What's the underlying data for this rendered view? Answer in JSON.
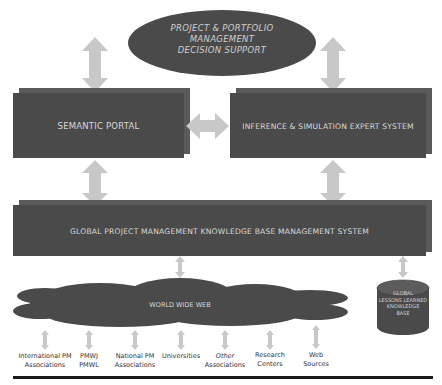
{
  "top_ellipse": {
    "line1": "PROJECT & PORTFOLIO",
    "line2": "MANAGEMENT",
    "line3": "DECISION SUPPORT"
  },
  "boxes": {
    "semantic_portal": "SEMANTIC  PORTAL",
    "inference": "INFERENCE & SIMULATION EXPERT SYSTEM",
    "global_kb": "GLOBAL PROJECT MANAGEMENT KNOWLEDGE BASE MANAGEMENT SYSTEM"
  },
  "cloud": {
    "label": "WORLD WIDE WEB"
  },
  "cylinder": {
    "line1": "GLOBAL",
    "line2": "LESSONS LEARNED",
    "line3": "KNOWLEDGE",
    "line4": "BASE"
  },
  "sources": [
    {
      "line1": "International PM",
      "line2": "Associations"
    },
    {
      "line1": "PMWJ",
      "line2": "PMWL"
    },
    {
      "line1": "National PM",
      "line2": "Associations"
    },
    {
      "line1": "Universities",
      "line2": ""
    },
    {
      "line1": "Other",
      "line2": "Associations"
    },
    {
      "line1": "Research",
      "line2": "Centers"
    },
    {
      "line1": "Web",
      "line2": "Sources"
    }
  ],
  "colors": {
    "box_fill": "#4a4a4a",
    "box_shadow": "#5a5a5a",
    "arrow_fill": "#c8c8c8",
    "text_light": "#d8d8d8"
  }
}
